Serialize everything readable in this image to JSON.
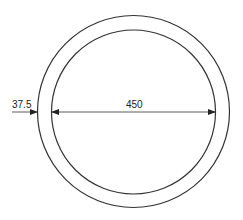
{
  "diagram": {
    "type": "annular-ring-cross-section",
    "colors": {
      "stroke": "#333333",
      "background": "#ffffff",
      "text": "#222222"
    },
    "outer_circle": {
      "cx": 133.5,
      "cy": 111.5,
      "r": 96
    },
    "inner_circle": {
      "cx": 133.5,
      "cy": 112,
      "r": 82
    },
    "dimensions": {
      "wall_thickness": {
        "label": "37.5"
      },
      "inner_diameter": {
        "label": "450"
      }
    }
  }
}
